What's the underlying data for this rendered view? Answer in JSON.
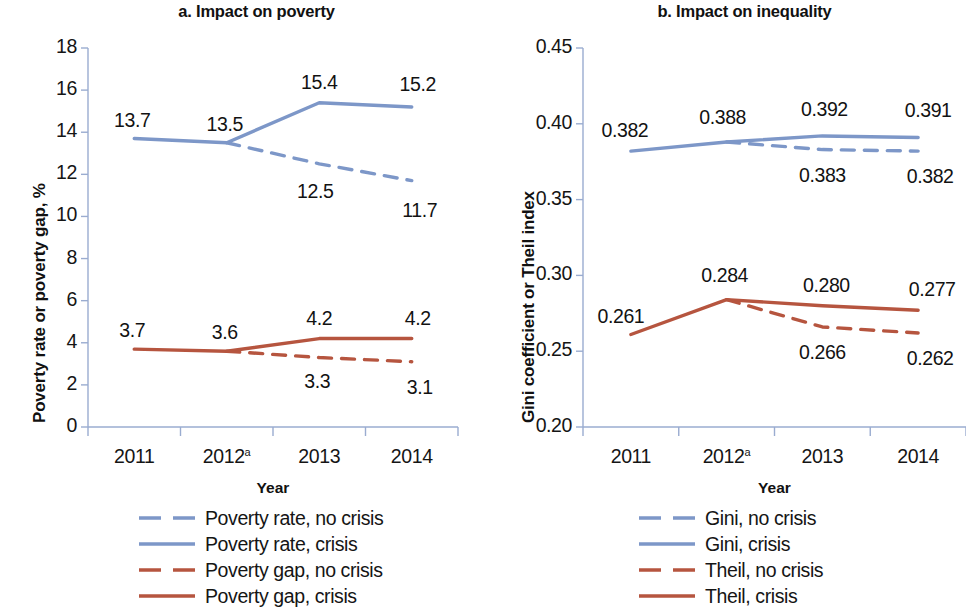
{
  "figure": {
    "background_color": "#ffffff",
    "series_colors": {
      "blue": "#7d97c8",
      "red": "#b6553f",
      "axis": "#9aacd0",
      "text": "#151515"
    }
  },
  "panels": [
    {
      "id": "a",
      "title": "a. Impact on poverty",
      "ylabel": "Poverty rate or poverty gap, %",
      "xlabel": "Year"
    },
    {
      "id": "b",
      "title": "b. Impact on inequality",
      "ylabel": "Gini coefficient or Theil index",
      "xlabel": "Year"
    }
  ],
  "legends": [
    {
      "panel": "a",
      "entries": [
        {
          "label": "Poverty rate, no crisis",
          "color": "#7d97c8",
          "style": "dashed"
        },
        {
          "label": "Poverty rate, crisis",
          "color": "#7d97c8",
          "style": "solid"
        },
        {
          "label": "Poverty gap, no crisis",
          "color": "#b6553f",
          "style": "dashed"
        },
        {
          "label": "Poverty gap, crisis",
          "color": "#b6553f",
          "style": "solid"
        }
      ]
    },
    {
      "panel": "b",
      "entries": [
        {
          "label": "Gini, no crisis",
          "color": "#7d97c8",
          "style": "dashed"
        },
        {
          "label": "Gini, crisis",
          "color": "#7d97c8",
          "style": "solid"
        },
        {
          "label": "Theil, no crisis",
          "color": "#b6553f",
          "style": "dashed"
        },
        {
          "label": "Theil, crisis",
          "color": "#b6553f",
          "style": "solid"
        }
      ]
    }
  ],
  "chart_data": [
    {
      "type": "line",
      "panel": "a",
      "title": "a. Impact on poverty",
      "xlabel": "Year",
      "ylabel": "Poverty rate or poverty gap, %",
      "categories": [
        "2011",
        "2012a",
        "2013",
        "2014"
      ],
      "tick_labels_x": [
        "2011",
        "2012ᵃ",
        "2013",
        "2014"
      ],
      "ylim": [
        0,
        18
      ],
      "yticks": [
        0,
        2,
        4,
        6,
        8,
        10,
        12,
        14,
        16,
        18
      ],
      "ytick_labels": [
        "0",
        "2",
        "4",
        "6",
        "8",
        "10",
        "12",
        "14",
        "16",
        "18"
      ],
      "grid": false,
      "legend_position": "below",
      "series": [
        {
          "name": "Poverty rate, crisis",
          "color": "#7d97c8",
          "style": "solid",
          "x": [
            "2011",
            "2012a",
            "2013",
            "2014"
          ],
          "values": [
            13.7,
            13.5,
            15.4,
            15.2
          ],
          "point_labels": [
            "13.7",
            "13.5",
            "15.4",
            "15.2"
          ]
        },
        {
          "name": "Poverty rate, no crisis",
          "color": "#7d97c8",
          "style": "dashed",
          "x": [
            "2012a",
            "2013",
            "2014"
          ],
          "values": [
            13.5,
            12.5,
            11.7
          ],
          "point_labels": [
            "",
            "12.5",
            "11.7"
          ]
        },
        {
          "name": "Poverty gap, crisis",
          "color": "#b6553f",
          "style": "solid",
          "x": [
            "2011",
            "2012a",
            "2013",
            "2014"
          ],
          "values": [
            3.7,
            3.6,
            4.2,
            4.2
          ],
          "point_labels": [
            "3.7",
            "3.6",
            "4.2",
            "4.2"
          ]
        },
        {
          "name": "Poverty gap, no crisis",
          "color": "#b6553f",
          "style": "dashed",
          "x": [
            "2012a",
            "2013",
            "2014"
          ],
          "values": [
            3.6,
            3.3,
            3.1
          ],
          "point_labels": [
            "",
            "3.3",
            "3.1"
          ]
        }
      ],
      "annotations": [
        {
          "text": "13.7",
          "series": "Poverty rate, crisis",
          "x": "2011",
          "value": 13.7
        },
        {
          "text": "13.5",
          "series": "Poverty rate, crisis",
          "x": "2012a",
          "value": 13.5
        },
        {
          "text": "15.4",
          "series": "Poverty rate, crisis",
          "x": "2013",
          "value": 15.4
        },
        {
          "text": "15.2",
          "series": "Poverty rate, crisis",
          "x": "2014",
          "value": 15.2
        },
        {
          "text": "12.5",
          "series": "Poverty rate, no crisis",
          "x": "2013",
          "value": 12.5
        },
        {
          "text": "11.7",
          "series": "Poverty rate, no crisis",
          "x": "2014",
          "value": 11.7
        },
        {
          "text": "3.7",
          "series": "Poverty gap, crisis",
          "x": "2011",
          "value": 3.7
        },
        {
          "text": "3.6",
          "series": "Poverty gap, crisis",
          "x": "2012a",
          "value": 3.6
        },
        {
          "text": "4.2",
          "series": "Poverty gap, crisis",
          "x": "2013",
          "value": 4.2
        },
        {
          "text": "4.2",
          "series": "Poverty gap, crisis",
          "x": "2014",
          "value": 4.2
        },
        {
          "text": "3.3",
          "series": "Poverty gap, no crisis",
          "x": "2013",
          "value": 3.3
        },
        {
          "text": "3.1",
          "series": "Poverty gap, no crisis",
          "x": "2014",
          "value": 3.1
        }
      ]
    },
    {
      "type": "line",
      "panel": "b",
      "title": "b. Impact on inequality",
      "xlabel": "Year",
      "ylabel": "Gini coefficient or Theil index",
      "categories": [
        "2011",
        "2012a",
        "2013",
        "2014"
      ],
      "tick_labels_x": [
        "2011",
        "2012ᵃ",
        "2013",
        "2014"
      ],
      "ylim": [
        0.2,
        0.45
      ],
      "yticks": [
        0.2,
        0.25,
        0.3,
        0.35,
        0.4,
        0.45
      ],
      "ytick_labels": [
        "0.20",
        "0.25",
        "0.30",
        "0.35",
        "0.40",
        "0.45"
      ],
      "grid": false,
      "legend_position": "below",
      "series": [
        {
          "name": "Gini, crisis",
          "color": "#7d97c8",
          "style": "solid",
          "x": [
            "2011",
            "2012a",
            "2013",
            "2014"
          ],
          "values": [
            0.382,
            0.388,
            0.392,
            0.391
          ],
          "point_labels": [
            "0.382",
            "0.388",
            "0.392",
            "0.391"
          ]
        },
        {
          "name": "Gini, no crisis",
          "color": "#7d97c8",
          "style": "dashed",
          "x": [
            "2012a",
            "2013",
            "2014"
          ],
          "values": [
            0.388,
            0.383,
            0.382
          ],
          "point_labels": [
            "",
            "0.383",
            "0.382"
          ]
        },
        {
          "name": "Theil, crisis",
          "color": "#b6553f",
          "style": "solid",
          "x": [
            "2011",
            "2012a",
            "2013",
            "2014"
          ],
          "values": [
            0.261,
            0.284,
            0.28,
            0.277
          ],
          "point_labels": [
            "0.261",
            "0.284",
            "0.280",
            "0.277"
          ]
        },
        {
          "name": "Theil, no crisis",
          "color": "#b6553f",
          "style": "dashed",
          "x": [
            "2012a",
            "2013",
            "2014"
          ],
          "values": [
            0.284,
            0.266,
            0.262
          ],
          "point_labels": [
            "",
            "0.266",
            "0.262"
          ]
        }
      ],
      "annotations": [
        {
          "text": "0.382",
          "series": "Gini, crisis",
          "x": "2011",
          "value": 0.382
        },
        {
          "text": "0.388",
          "series": "Gini, crisis",
          "x": "2012a",
          "value": 0.388
        },
        {
          "text": "0.392",
          "series": "Gini, crisis",
          "x": "2013",
          "value": 0.392
        },
        {
          "text": "0.391",
          "series": "Gini, crisis",
          "x": "2014",
          "value": 0.391
        },
        {
          "text": "0.383",
          "series": "Gini, no crisis",
          "x": "2013",
          "value": 0.383
        },
        {
          "text": "0.382",
          "series": "Gini, no crisis",
          "x": "2014",
          "value": 0.382
        },
        {
          "text": "0.261",
          "series": "Theil, crisis",
          "x": "2011",
          "value": 0.261
        },
        {
          "text": "0.284",
          "series": "Theil, crisis",
          "x": "2012a",
          "value": 0.284
        },
        {
          "text": "0.280",
          "series": "Theil, crisis",
          "x": "2013",
          "value": 0.28
        },
        {
          "text": "0.277",
          "series": "Theil, crisis",
          "x": "2014",
          "value": 0.277
        },
        {
          "text": "0.266",
          "series": "Theil, no crisis",
          "x": "2013",
          "value": 0.266
        },
        {
          "text": "0.262",
          "series": "Theil, no crisis",
          "x": "2014",
          "value": 0.262
        }
      ]
    }
  ]
}
